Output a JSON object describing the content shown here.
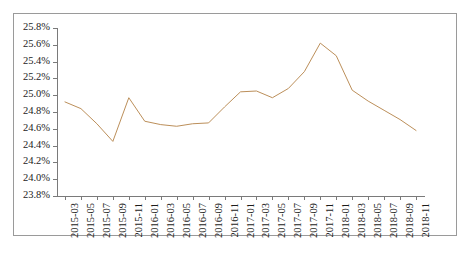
{
  "chart_data": {
    "type": "line",
    "title": "",
    "subtitle": "",
    "xlabel": "",
    "ylabel": "",
    "grid": false,
    "legend": null,
    "legend_position": "none",
    "line_color": "#bc8f5a",
    "axis_color": "#7a7a7a",
    "frame_color": "#9a9a9a",
    "background": "#ffffff",
    "ylim": [
      23.8,
      25.8
    ],
    "ytick_step": 0.2,
    "y_unit": "%",
    "ytick_labels": [
      "25.8%",
      "25.6%",
      "25.4%",
      "25.2%",
      "25.0%",
      "24.8%",
      "24.6%",
      "24.4%",
      "24.2%",
      "24.0%",
      "23.8%"
    ],
    "ytick_values": [
      25.8,
      25.6,
      25.4,
      25.2,
      25.0,
      24.8,
      24.6,
      24.4,
      24.2,
      24.0,
      23.8
    ],
    "categories": [
      "2015-03",
      "2015-05",
      "2015-07",
      "2015-09",
      "2015-11",
      "2016-01",
      "2016-03",
      "2016-05",
      "2016-07",
      "2016-09",
      "2016-11",
      "2017-01",
      "2017-03",
      "2017-05",
      "2017-07",
      "2017-09",
      "2017-11",
      "2018-01",
      "2018-03",
      "2018-05",
      "2018-07",
      "2018-09",
      "2018-11"
    ],
    "values": [
      24.92,
      24.84,
      24.66,
      24.45,
      24.97,
      24.69,
      24.65,
      24.63,
      24.66,
      24.67,
      24.86,
      25.04,
      25.05,
      24.97,
      25.08,
      25.28,
      25.62,
      25.47,
      25.06,
      24.93,
      24.82,
      24.71,
      24.58
    ],
    "series": [
      {
        "name": "series-1",
        "color": "#bc8f5a",
        "values": [
          24.92,
          24.84,
          24.66,
          24.45,
          24.97,
          24.69,
          24.65,
          24.63,
          24.66,
          24.67,
          24.86,
          25.04,
          25.05,
          24.97,
          25.08,
          25.28,
          25.62,
          25.47,
          25.06,
          24.93,
          24.82,
          24.71,
          24.58
        ]
      }
    ]
  }
}
